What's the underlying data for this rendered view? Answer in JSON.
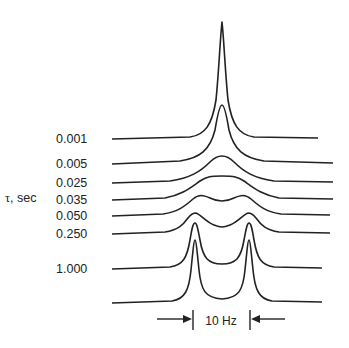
{
  "axis_label": {
    "symbol": "τ",
    "text": ", sec"
  },
  "traces": [
    {
      "label": "0.001",
      "baseline_y": 139
    },
    {
      "label": "0.005",
      "baseline_y": 164
    },
    {
      "label": "0.025",
      "baseline_y": 183
    },
    {
      "label": "0.035",
      "baseline_y": 200
    },
    {
      "label": "0.050",
      "baseline_y": 216
    },
    {
      "label": "0.250",
      "baseline_y": 234
    },
    {
      "label": "1.000",
      "baseline_y": 269
    },
    {
      "label": "",
      "baseline_y": 303
    }
  ],
  "scale_marker": {
    "label": "10 Hz"
  }
}
